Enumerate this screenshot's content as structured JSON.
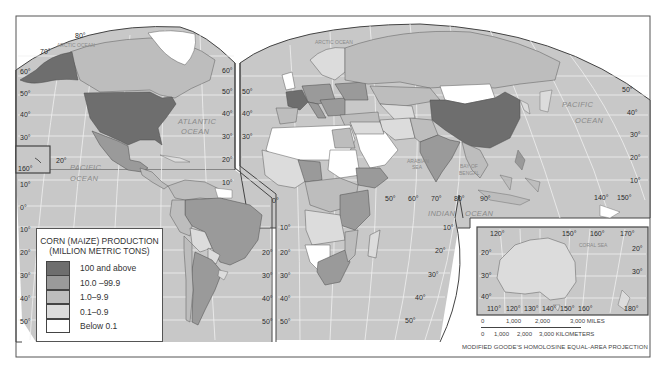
{
  "map": {
    "title": "Corn (Maize) Production",
    "projection": "MODIFIED GOODE'S HOMOLOSINE EQUAL-AREA PROJECTION",
    "colors": {
      "ocean": "#c8c8c8",
      "graticule": "#f2f2f2",
      "border": "#4a4a4a",
      "class_100_plus": "#6e6e6e",
      "class_10_99": "#9a9a9a",
      "class_1_9": "#bdbdbd",
      "class_01_09": "#dcdcdc",
      "class_below_01": "#ffffff"
    },
    "ocean_labels": {
      "arctic_left": "ARCTIC OCEAN",
      "arctic_right": "ARCTIC OCEAN",
      "atlantic_1": "ATLANTIC",
      "atlantic_2": "OCEAN",
      "pacific_w_1": "PACIFIC",
      "pacific_w_2": "OCEAN",
      "pacific_e_1": "PACIFIC",
      "pacific_e_2": "OCEAN",
      "indian_1": "INDIAN",
      "indian_2": "OCEAN",
      "arabian_1": "ARABIAN",
      "arabian_2": "SEA",
      "bengal_1": "BAY OF",
      "bengal_2": "BENGAL",
      "coral": "CORAL SEA"
    },
    "lat_labels_left": [
      "70°",
      "60°",
      "50°",
      "40°",
      "30°",
      "20°",
      "10°",
      "0°",
      "10°",
      "20°",
      "30°",
      "40°",
      "50°"
    ],
    "lat_labels_americas_right": [
      "60°",
      "50°",
      "40°",
      "30°",
      "20°",
      "10°"
    ],
    "lat_labels_atlantic_left": [
      "50°",
      "40°",
      "30°"
    ],
    "lat_labels_s_atlantic": [
      "20°",
      "30°",
      "40°",
      "50°"
    ],
    "lat_labels_s_africa_left": [
      "10°",
      "20°",
      "30°",
      "40°",
      "50°"
    ],
    "lat_labels_s_africa_right": [
      "10°",
      "20°",
      "30°",
      "40°",
      "50°"
    ],
    "lat_labels_pacific_right": [
      "50°",
      "40°",
      "30°",
      "20°",
      "10°"
    ],
    "lon_labels_indian": [
      "50°",
      "60°",
      "70°",
      "80°",
      "90°"
    ],
    "lon_labels_pacific": [
      "140°",
      "150°"
    ],
    "other_labels": {
      "lat80": "80°",
      "hawaii_lon": "160°",
      "hawaii_lat": "20°",
      "equator_africa": "0°",
      "equator_pacific_right": "0°"
    },
    "inset": {
      "name": "Australia inset",
      "top_lon_labels": [
        "120°",
        "150°",
        "160°",
        "170°"
      ],
      "bottom_lon_labels": [
        "110°",
        "120°",
        "130°",
        "140°",
        "150°",
        "160°",
        "180°"
      ],
      "left_lat_labels": [
        "20°",
        "30°",
        "40°"
      ],
      "right_lat_labels": [
        "20°",
        "30°"
      ]
    },
    "legend": {
      "title_line1": "CORN (MAIZE) PRODUCTION",
      "title_line2": "(MILLION METRIC TONS)",
      "items": [
        {
          "label": "100 and above",
          "color": "#6e6e6e"
        },
        {
          "label": "10.0 –99.9",
          "color": "#9a9a9a"
        },
        {
          "label": "1.0–9.9",
          "color": "#bdbdbd"
        },
        {
          "label": "0.1–0.9",
          "color": "#dcdcdc"
        },
        {
          "label": "Below 0.1",
          "color": "#ffffff"
        }
      ]
    },
    "scale": {
      "miles": [
        "0",
        "1,000",
        "2,000",
        "3,000 MILES"
      ],
      "km": [
        "0",
        "1,000",
        "2,000",
        "3,000 KILOMETERS"
      ]
    }
  }
}
